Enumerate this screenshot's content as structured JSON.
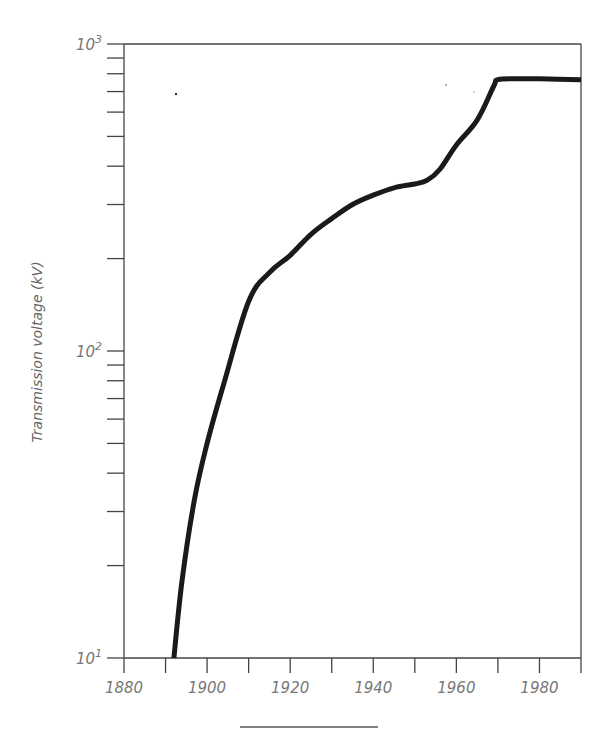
{
  "chart_data": {
    "type": "line",
    "title": "",
    "xlabel": "",
    "ylabel": "Transmission voltage (kV)",
    "xlim": [
      1880,
      1990
    ],
    "ylim": [
      10,
      1000
    ],
    "yscale": "log",
    "grid": false,
    "x_ticks": [
      1880,
      1890,
      1900,
      1910,
      1920,
      1930,
      1940,
      1950,
      1960,
      1970,
      1980,
      1990
    ],
    "x_tick_labels": [
      "1880",
      "1900",
      "1920",
      "1940",
      "1960",
      "1980"
    ],
    "y_tick_labels": [
      {
        "base": "10",
        "exp": "1",
        "value": 10
      },
      {
        "base": "10",
        "exp": "2",
        "value": 100
      },
      {
        "base": "10",
        "exp": "3",
        "value": 1000
      }
    ],
    "series": [
      {
        "name": "Maximum transmission voltage",
        "color": "#1a1a1a",
        "x": [
          1892,
          1894,
          1897,
          1900,
          1904,
          1910,
          1915,
          1920,
          1925,
          1930,
          1935,
          1940,
          1945,
          1950,
          1953,
          1956,
          1960,
          1965,
          1969,
          1970,
          1975,
          1980,
          1990
        ],
        "y": [
          10,
          18,
          33,
          50,
          78,
          145,
          180,
          205,
          240,
          270,
          300,
          322,
          340,
          350,
          360,
          390,
          469,
          565,
          730,
          765,
          770,
          770,
          765
        ]
      }
    ]
  }
}
